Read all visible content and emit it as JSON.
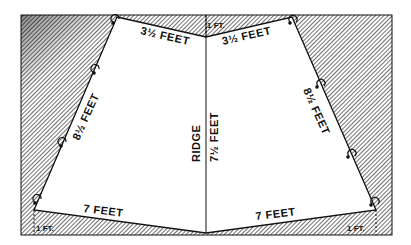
{
  "diagram": {
    "labels": {
      "left_top_edge": "3½ FEET",
      "right_top_edge": "3½ FEET",
      "left_side_edge": "8½ FEET",
      "right_side_edge": "8½ FEET",
      "left_bottom_edge": "7 FEET",
      "right_bottom_edge": "7 FEET",
      "ridge": "RIDGE",
      "ridge_length": "7½ FEET",
      "top_offset": "1 FT.",
      "bottom_left_offset": "1 FT.",
      "bottom_right_offset": "1 FT."
    },
    "colors": {
      "line": "#111111",
      "hatch": "#333333",
      "background": "#ffffff"
    }
  }
}
